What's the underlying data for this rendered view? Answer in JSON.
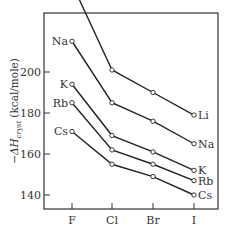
{
  "chart_data": {
    "type": "line",
    "title": "",
    "xlabel": "",
    "ylabel": "−ΔH_cryst (kcal/mole)",
    "ylabel_main": "−ΔH",
    "ylabel_sub": "cryst",
    "ylabel_unit": "(kcal/mole)",
    "categories": [
      "F",
      "Cl",
      "Br",
      "I"
    ],
    "yticks": [
      140,
      160,
      180,
      200,
      240
    ],
    "ylim": [
      135,
      248
    ],
    "grid": false,
    "legend_position": "inline labels at series ends",
    "series": [
      {
        "name": "Li",
        "values": [
          243,
          201,
          190,
          179
        ]
      },
      {
        "name": "Na",
        "values": [
          215,
          185,
          176,
          165
        ]
      },
      {
        "name": "K",
        "values": [
          194,
          169,
          161,
          152
        ]
      },
      {
        "name": "Rb",
        "values": [
          185,
          162,
          155,
          147
        ]
      },
      {
        "name": "Cs",
        "values": [
          171,
          155,
          149,
          140
        ]
      }
    ]
  }
}
